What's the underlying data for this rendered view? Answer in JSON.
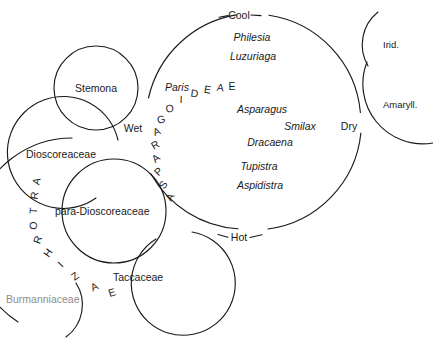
{
  "figure": {
    "line_color": "#1a1a1a",
    "text_color": "#1a1a1a",
    "faded_text_color": "#8d8d8d",
    "background": "#ffffff"
  },
  "climate_axis": {
    "top": "Cool",
    "bottom": "Hot",
    "left": "Wet",
    "right": "Dry"
  },
  "asparagoideae": {
    "arc_label": "ASPARAGOIDEAE",
    "arc_letters": [
      "A",
      "S",
      "P",
      "A",
      "R",
      "A",
      "G",
      "O",
      "I",
      "D",
      "E",
      "A",
      "E"
    ],
    "genera": [
      {
        "name": "Philesia",
        "x": 252,
        "y": 41
      },
      {
        "name": "Luzuriaga",
        "x": 253,
        "y": 60
      },
      {
        "name": "Paris",
        "x": 174,
        "y": 88
      },
      {
        "name": "Asparagus",
        "x": 260,
        "y": 114
      },
      {
        "name": "Smilax",
        "x": 299,
        "y": 130
      },
      {
        "name": "Dracaena",
        "x": 268,
        "y": 146
      },
      {
        "name": "Tupistra",
        "x": 258,
        "y": 170
      },
      {
        "name": "Aspidistra",
        "x": 257,
        "y": 188
      }
    ]
  },
  "taxa": [
    {
      "key": "stemona",
      "label": "Stemona",
      "x": 97,
      "y": 88,
      "style": "plain"
    },
    {
      "key": "dioscoreaceae",
      "label": "Dioscoreaceae",
      "x": 26,
      "y": 158,
      "style": "plain"
    },
    {
      "key": "para-dioscoreaceae",
      "label": "para-Dioscoreaceae",
      "x": 55,
      "y": 212,
      "style": "plain"
    },
    {
      "key": "taccaceae",
      "label": "Taccaceae",
      "x": 113,
      "y": 278,
      "style": "plain"
    },
    {
      "key": "burmanniaceae",
      "label": "Burmanniaceae",
      "x": 8,
      "y": 301,
      "style": "faded"
    },
    {
      "key": "iridaceae",
      "label": "Irid.",
      "x": 381,
      "y": 45,
      "style": "small"
    },
    {
      "key": "amaryllidaceae",
      "label": "Amaryll.",
      "x": 382,
      "y": 105,
      "style": "small"
    }
  ],
  "artorhizae": {
    "arc_label": "ARTORHIZAE",
    "arc_letters": [
      "A",
      "R",
      "T",
      "O",
      "R",
      "H",
      "I",
      "Z",
      "A",
      "E"
    ]
  }
}
